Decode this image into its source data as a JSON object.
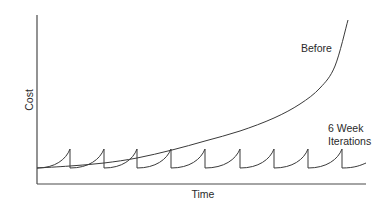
{
  "chart_data": {
    "type": "line",
    "title": "",
    "xlabel": "Time",
    "ylabel": "Cost",
    "grid": false,
    "legend": "inline annotations",
    "axis_ticks": false,
    "series": [
      {
        "name": "Before",
        "shape": "exponential increase",
        "points_px": [
          [
            37,
            168
          ],
          [
            70,
            166
          ],
          [
            104,
            163
          ],
          [
            137,
            158
          ],
          [
            172,
            150
          ],
          [
            205,
            141
          ],
          [
            240,
            131
          ],
          [
            274,
            118
          ],
          [
            300,
            104
          ],
          [
            320,
            88
          ],
          [
            335,
            66
          ],
          [
            348,
            20
          ]
        ]
      },
      {
        "name": "6 Week Iterations",
        "shape": "repeating sawtooth (cost rises within each iteration, resets at end)",
        "iteration_count": 10,
        "baseline_px": 168,
        "peak_px": 149,
        "peaks_x_px": [
          70,
          104,
          137,
          171,
          205,
          240,
          274,
          308,
          342
        ],
        "end_x_px": 366
      }
    ],
    "annotations": [
      {
        "text": "Before",
        "x": 301,
        "y": 52
      },
      {
        "text": "6 Week",
        "x": 327,
        "y": 132
      },
      {
        "text": "Iterations",
        "x": 327,
        "y": 145
      }
    ]
  },
  "labels": {
    "x_axis": "Time",
    "y_axis": "Cost",
    "before": "Before",
    "iterations_line1": "6 Week",
    "iterations_line2": "Iterations"
  }
}
